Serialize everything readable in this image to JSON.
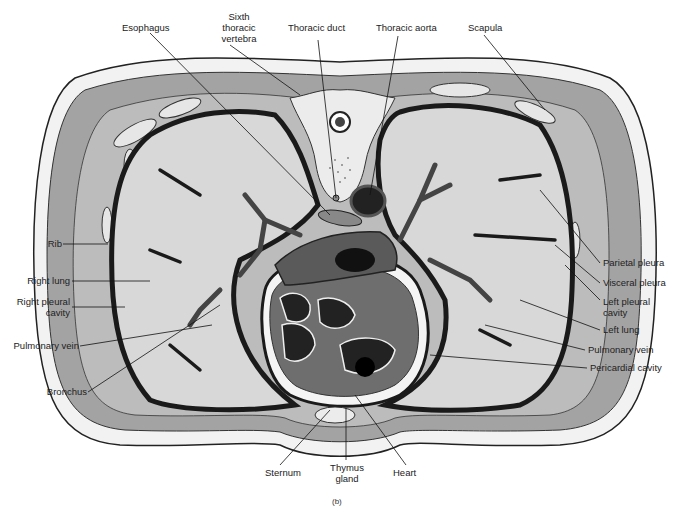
{
  "figure": {
    "caption": "(b)",
    "colors": {
      "lung": "#d8d8d8",
      "muscle": "#9a9a9a",
      "fat": "#f2f2f2",
      "pleura": "#2a2a2a",
      "heart": "#6e6e6e",
      "vessel": "#555555",
      "dark": "#111111"
    }
  },
  "labels": {
    "top": [
      {
        "id": "esophagus",
        "text": "Esophagus"
      },
      {
        "id": "sixth_vertebra_1",
        "text": "Sixth"
      },
      {
        "id": "sixth_vertebra_2",
        "text": "thoracic"
      },
      {
        "id": "sixth_vertebra_3",
        "text": "vertebra"
      },
      {
        "id": "thoracic_duct",
        "text": "Thoracic duct"
      },
      {
        "id": "thoracic_aorta",
        "text": "Thoracic aorta"
      },
      {
        "id": "scapula",
        "text": "Scapula"
      }
    ],
    "left": [
      {
        "id": "rib",
        "text": "Rib"
      },
      {
        "id": "right_lung",
        "text": "Right lung"
      },
      {
        "id": "right_pleural_1",
        "text": "Right pleural"
      },
      {
        "id": "right_pleural_2",
        "text": "cavity"
      },
      {
        "id": "pulmonary_vein_left",
        "text": "Pulmonary vein"
      },
      {
        "id": "bronchus",
        "text": "Bronchus"
      }
    ],
    "right": [
      {
        "id": "parietal_pleura",
        "text": "Parietal pleura"
      },
      {
        "id": "visceral_pleura",
        "text": "Visceral pleura"
      },
      {
        "id": "left_pleural_1",
        "text": "Left pleural"
      },
      {
        "id": "left_pleural_2",
        "text": "cavity"
      },
      {
        "id": "left_lung",
        "text": "Left lung"
      },
      {
        "id": "pulmonary_vein_right",
        "text": "Pulmonary vein"
      },
      {
        "id": "pericardial_cavity",
        "text": "Pericardial cavity"
      }
    ],
    "bottom": [
      {
        "id": "sternum",
        "text": "Sternum"
      },
      {
        "id": "thymus_1",
        "text": "Thymus"
      },
      {
        "id": "thymus_2",
        "text": "gland"
      },
      {
        "id": "heart",
        "text": "Heart"
      }
    ]
  }
}
